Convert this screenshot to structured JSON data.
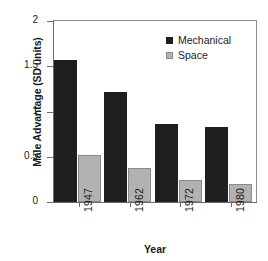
{
  "chart_data": {
    "type": "bar",
    "title": "",
    "xlabel": "Year",
    "ylabel": "Male Advantage (SD units)",
    "categories": [
      "1947",
      "1962",
      "1972",
      "1980"
    ],
    "series": [
      {
        "name": "Mechanical",
        "color": "#1f1f1f",
        "values": [
          1.57,
          1.22,
          0.86,
          0.83
        ]
      },
      {
        "name": "Space",
        "color": "#b2b2b2",
        "values": [
          0.52,
          0.38,
          0.24,
          0.2
        ]
      }
    ],
    "ylim": [
      0,
      2
    ],
    "yticks": [
      0,
      0.5,
      1,
      1.5,
      2
    ],
    "ytick_labels": [
      "0",
      "0.5",
      "1",
      "1.5",
      "2"
    ],
    "grid": false,
    "legend_position": "top-right",
    "xtick_rotation": 90
  },
  "legend": {
    "items": [
      {
        "label": "Mechanical",
        "swatch": "dark-square-swatch"
      },
      {
        "label": "Space",
        "swatch": "light-square-swatch"
      }
    ]
  },
  "axes": {
    "x_title": "Year",
    "y_title": "Male Advantage (SD units)"
  }
}
